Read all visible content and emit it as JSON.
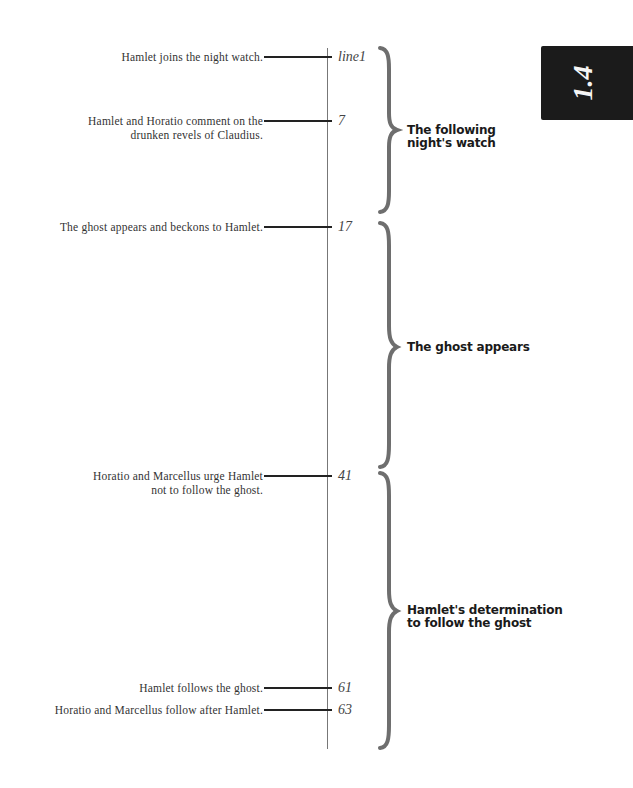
{
  "scene_tab": {
    "label": "1.4",
    "background": "#1b1b1b"
  },
  "events": [
    {
      "text_lines": [
        "Hamlet joins the night watch."
      ],
      "line": "line1"
    },
    {
      "text_lines": [
        "Hamlet and Horatio comment on the",
        "drunken revels of Claudius."
      ],
      "line": "7"
    },
    {
      "text_lines": [
        "The ghost appears and beckons to Hamlet."
      ],
      "line": "17"
    },
    {
      "text_lines": [
        "Horatio and Marcellus urge Hamlet",
        "not to follow the ghost."
      ],
      "line": "41"
    },
    {
      "text_lines": [
        "Hamlet follows the ghost."
      ],
      "line": "61"
    },
    {
      "text_lines": [
        "Horatio and Marcellus follow after Hamlet."
      ],
      "line": "63"
    }
  ],
  "sections": [
    {
      "label_lines": [
        "The following",
        "night's watch"
      ],
      "from_line": "1",
      "to_line": "16"
    },
    {
      "label_lines": [
        "The ghost appears"
      ],
      "from_line": "17",
      "to_line": "40"
    },
    {
      "label_lines": [
        "Hamlet's determination",
        "to follow the ghost"
      ],
      "from_line": "41",
      "to_line": "end"
    }
  ],
  "colors": {
    "timeline": "#777777",
    "brace": "#6e6e6e",
    "text": "#333333",
    "heading": "#1a1a1a"
  }
}
